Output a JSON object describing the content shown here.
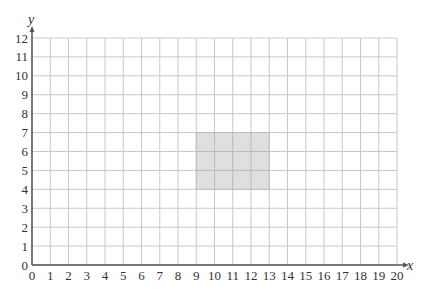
{
  "chart_data": {
    "type": "grid",
    "title": "",
    "xlabel": "x",
    "ylabel": "y",
    "xlim": [
      0,
      20
    ],
    "ylim": [
      0,
      12
    ],
    "grid": true,
    "x_ticks": [
      0,
      1,
      2,
      3,
      4,
      5,
      6,
      7,
      8,
      9,
      10,
      11,
      12,
      13,
      14,
      15,
      16,
      17,
      18,
      19,
      20
    ],
    "y_ticks": [
      0,
      1,
      2,
      3,
      4,
      5,
      6,
      7,
      8,
      9,
      10,
      11,
      12
    ],
    "shapes": [
      {
        "type": "rectangle",
        "x_min": 9,
        "x_max": 13,
        "y_min": 4,
        "y_max": 7,
        "fill": "#d9d9d9"
      }
    ]
  },
  "colors": {
    "grid": "#c8c8c8",
    "axis": "#555555",
    "shape_fill": "#d9d9d9"
  }
}
